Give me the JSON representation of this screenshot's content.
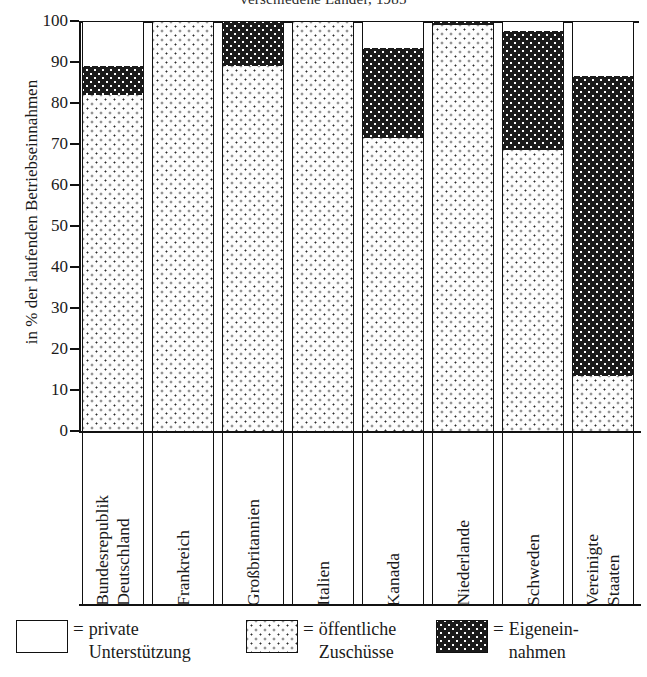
{
  "chart": {
    "title": "verschiedene Länder, 1985",
    "y_axis_title": "in % der laufenden Betriebseinnahmen"
  },
  "legend": {
    "items": [
      {
        "key": "white",
        "eq": "=",
        "label": "private\nUnterstützung",
        "swatch": "white-swatch"
      },
      {
        "key": "light",
        "eq": "=",
        "label": "öffentliche\nZuschüsse",
        "swatch": "light-dotted-swatch"
      },
      {
        "key": "dark",
        "eq": "=",
        "label": "Eigenein-\nnahmen",
        "swatch": "dark-dotted-swatch"
      }
    ]
  },
  "chart_data": {
    "type": "bar",
    "subtype": "stacked-100-percent",
    "title": "verschiedene Länder, 1985",
    "xlabel": "",
    "ylabel": "in % der laufenden Betriebseinnahmen",
    "ylim": [
      0,
      100
    ],
    "yticks": [
      0,
      10,
      20,
      30,
      40,
      50,
      60,
      70,
      80,
      90,
      100
    ],
    "ytick_labels": [
      "0",
      "10",
      "20",
      "30",
      "40",
      "50",
      "60",
      "70",
      "80",
      "90",
      "100"
    ],
    "grid": false,
    "legend_position": "bottom",
    "categories": [
      "Bundesrepublik\nDeutschland",
      "Frankreich",
      "Großbritannien",
      "Italien",
      "Kanada",
      "Niederlande",
      "Schweden",
      "Vereinigte\nStaaten"
    ],
    "series": [
      {
        "name": "öffentliche Zuschüsse",
        "fill": "light",
        "values": [
          82,
          100,
          89,
          100,
          71.5,
          99,
          68.5,
          13.5
        ]
      },
      {
        "name": "Eigeneinnahmen",
        "fill": "dark",
        "values": [
          7,
          0,
          11,
          0,
          22,
          1,
          29,
          73
        ]
      },
      {
        "name": "private Unterstützung",
        "fill": "white",
        "values": [
          11,
          0,
          0,
          0,
          6.5,
          0,
          2.5,
          13.5
        ]
      }
    ]
  }
}
